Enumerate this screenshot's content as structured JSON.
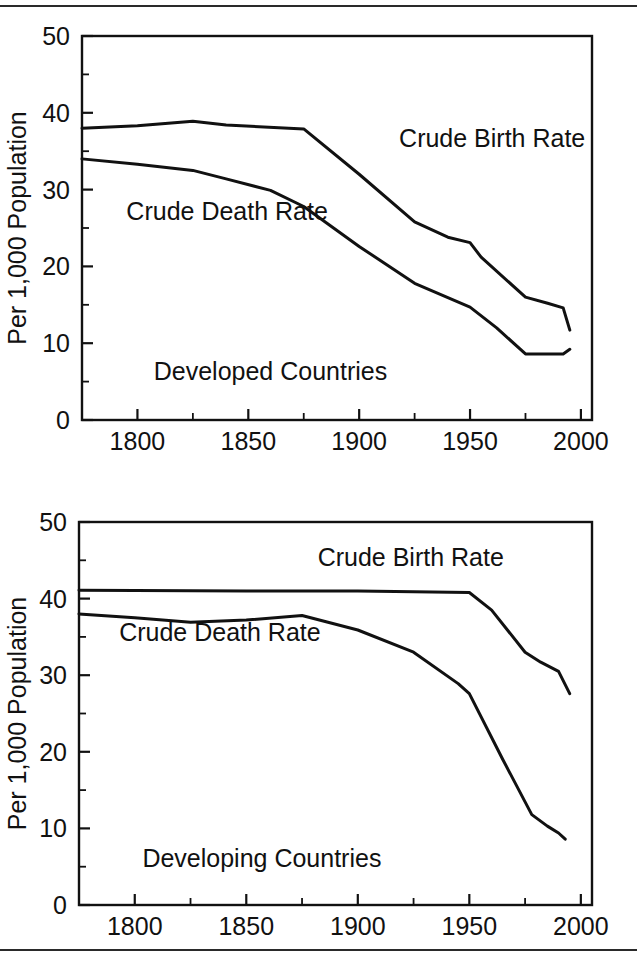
{
  "figure": {
    "background": "#ffffff",
    "line_color": "#111111",
    "top_rule": true,
    "bottom_rule": true
  },
  "chart_data": [
    {
      "type": "line",
      "title": "Developed Countries",
      "panel_name": "developed-countries",
      "xlabel": "",
      "ylabel": "Per 1,000 Population",
      "xlim": [
        1775,
        2005
      ],
      "ylim": [
        0,
        50
      ],
      "xticks": [
        1800,
        1850,
        1900,
        1950,
        2000
      ],
      "xticklabels": [
        "1800",
        "1850",
        "1900",
        "1950",
        "2000"
      ],
      "xminorticks": [
        1775,
        1825,
        1875,
        1925,
        1975
      ],
      "yticks": [
        0,
        10,
        20,
        30,
        40,
        50
      ],
      "yticklabels": [
        "0",
        "10",
        "20",
        "30",
        "40",
        "50"
      ],
      "yminorticks": [
        5,
        15,
        25,
        35,
        45
      ],
      "grid": false,
      "legend": "inline-annotations",
      "annotations": [
        {
          "text": "Crude Birth Rate",
          "x": 1918,
          "y": 35.6,
          "anchor": "start"
        },
        {
          "text": "Crude Death Rate",
          "x": 1795,
          "y": 26.0,
          "anchor": "start"
        },
        {
          "text": "Developed Countries",
          "x": 1860,
          "y": 5.2,
          "anchor": "middle"
        }
      ],
      "series": [
        {
          "name": "Crude Birth Rate",
          "x": [
            1775,
            1800,
            1825,
            1840,
            1875,
            1900,
            1925,
            1940,
            1950,
            1955,
            1975,
            1985,
            1992,
            1995
          ],
          "values": [
            38.0,
            38.3,
            38.9,
            38.4,
            37.9,
            32.0,
            25.8,
            23.8,
            23.1,
            21.2,
            16.0,
            15.2,
            14.6,
            11.7
          ]
        },
        {
          "name": "Crude Death Rate",
          "x": [
            1775,
            1800,
            1825,
            1840,
            1860,
            1875,
            1900,
            1925,
            1950,
            1962,
            1975,
            1985,
            1992,
            1995
          ],
          "values": [
            34.0,
            33.3,
            32.5,
            31.4,
            29.9,
            27.8,
            22.6,
            17.8,
            14.7,
            12.0,
            8.6,
            8.6,
            8.6,
            9.2
          ]
        }
      ]
    },
    {
      "type": "line",
      "title": "Developing Countries",
      "panel_name": "developing-countries",
      "xlabel": "",
      "ylabel": "Per 1,000 Population",
      "xlim": [
        1775,
        2005
      ],
      "ylim": [
        0,
        50
      ],
      "xticks": [
        1800,
        1850,
        1900,
        1950,
        2000
      ],
      "xticklabels": [
        "1800",
        "1850",
        "1900",
        "1950",
        "2000"
      ],
      "xminorticks": [
        1775,
        1825,
        1875,
        1925,
        1975
      ],
      "yticks": [
        0,
        10,
        20,
        30,
        40,
        50
      ],
      "yticklabels": [
        "0",
        "10",
        "20",
        "30",
        "40",
        "50"
      ],
      "yminorticks": [
        5,
        15,
        25,
        35,
        45
      ],
      "grid": false,
      "legend": "inline-annotations",
      "annotations": [
        {
          "text": "Crude Birth Rate",
          "x": 1882,
          "y": 44.3,
          "anchor": "start"
        },
        {
          "text": "Crude Death Rate",
          "x": 1793,
          "y": 34.4,
          "anchor": "start"
        },
        {
          "text": "Developing Countries",
          "x": 1857,
          "y": 5.0,
          "anchor": "middle"
        }
      ],
      "series": [
        {
          "name": "Crude Birth Rate",
          "x": [
            1775,
            1850,
            1900,
            1950,
            1960,
            1975,
            1982,
            1990,
            1995
          ],
          "values": [
            41.1,
            41.0,
            41.0,
            40.8,
            38.5,
            33.0,
            31.7,
            30.5,
            27.6
          ]
        },
        {
          "name": "Crude Death Rate",
          "x": [
            1775,
            1800,
            1825,
            1850,
            1875,
            1900,
            1925,
            1945,
            1950,
            1965,
            1978,
            1985,
            1990,
            1993
          ],
          "values": [
            38.0,
            37.5,
            36.9,
            37.2,
            37.8,
            35.9,
            33.0,
            28.9,
            27.6,
            19.0,
            11.8,
            10.3,
            9.4,
            8.6
          ]
        }
      ]
    }
  ]
}
